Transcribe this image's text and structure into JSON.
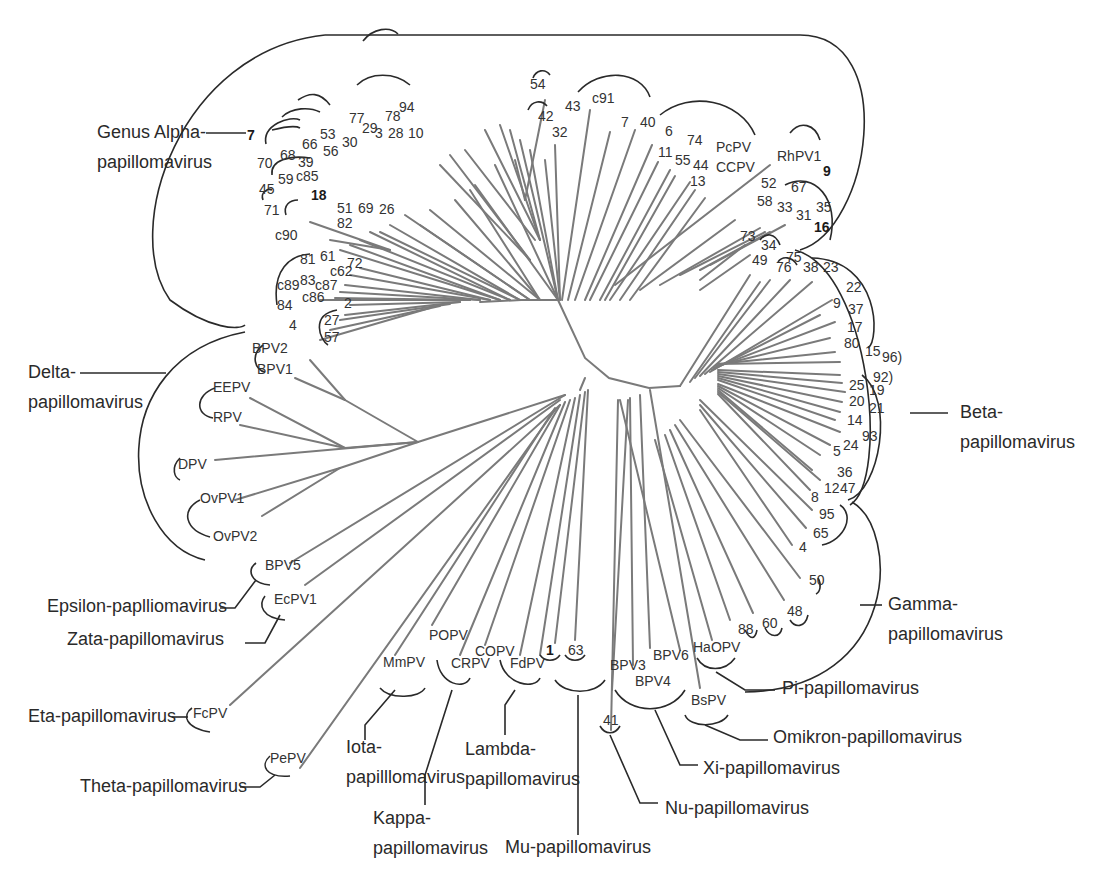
{
  "diagram": {
    "type": "unrooted-phylogenetic-tree",
    "colors": {
      "branch": "#7a7a7a",
      "bracket": "#2a2a2a",
      "text": "#333333"
    },
    "genera": [
      {
        "id": "alpha",
        "lines": [
          "Genus Alpha-",
          "papillomavirus"
        ]
      },
      {
        "id": "beta",
        "lines": [
          "Beta-",
          "papillomavirus"
        ]
      },
      {
        "id": "gamma",
        "lines": [
          "Gamma-",
          "papillomavirus"
        ]
      },
      {
        "id": "delta",
        "lines": [
          "Delta-",
          "papillomavirus"
        ]
      },
      {
        "id": "epsilon",
        "lines": [
          "Epsilon-paplliomavirus"
        ]
      },
      {
        "id": "zeta",
        "lines": [
          "Zata-papillomavirus"
        ]
      },
      {
        "id": "eta",
        "lines": [
          "Eta-papillomavirus"
        ]
      },
      {
        "id": "theta",
        "lines": [
          "Theta-papillomavirus"
        ]
      },
      {
        "id": "iota",
        "lines": [
          "Iota-",
          "papilllomavirus"
        ]
      },
      {
        "id": "kappa",
        "lines": [
          "Kappa-",
          "papillomavirus"
        ]
      },
      {
        "id": "lambda",
        "lines": [
          "Lambda-",
          "papillomavirus"
        ]
      },
      {
        "id": "mu",
        "lines": [
          "Mu-papillomavirus"
        ]
      },
      {
        "id": "nu",
        "lines": [
          "Nu-papillomavirus"
        ]
      },
      {
        "id": "xi",
        "lines": [
          "Xi-papillomavirus"
        ]
      },
      {
        "id": "omikron",
        "lines": [
          "Omikron-papillomavirus"
        ]
      },
      {
        "id": "pi",
        "lines": [
          "Pi-papillomavirus"
        ]
      }
    ],
    "leaves": {
      "alpha": [
        "7",
        "70",
        "68",
        "45",
        "59",
        "39",
        "c85",
        "18",
        "51",
        "69",
        "26",
        "82",
        "66",
        "53",
        "56",
        "30",
        "77",
        "29",
        "3",
        "78",
        "28",
        "94",
        "10",
        "54",
        "42",
        "32",
        "43",
        "c91",
        "7",
        "40",
        "6",
        "11",
        "74",
        "55",
        "44",
        "13",
        "PcPV",
        "CCPV",
        "RhPV1",
        "9",
        "52",
        "67",
        "58",
        "33",
        "31",
        "35",
        "16",
        "71",
        "c90",
        "81",
        "61",
        "72",
        "c62",
        "c89",
        "83",
        "c87",
        "c86",
        "84",
        "2",
        "27",
        "57",
        "4"
      ],
      "beta": [
        "73",
        "34",
        "49",
        "76",
        "75",
        "38",
        "23",
        "22",
        "9",
        "37",
        "17",
        "80",
        "15",
        "96",
        "92",
        "25",
        "19",
        "20",
        "21",
        "14",
        "93",
        "24",
        "5",
        "36",
        "12",
        "47",
        "8"
      ],
      "gamma": [
        "95",
        "65",
        "4",
        "50",
        "48",
        "60",
        "88"
      ],
      "delta": [
        "BPV2",
        "BPV1",
        "EEPV",
        "RPV",
        "DPV",
        "OvPV1",
        "OvPV2"
      ],
      "epsilon": [
        "BPV5"
      ],
      "zeta": [
        "EcPV1"
      ],
      "eta": [
        "FcPV"
      ],
      "theta": [
        "PePV"
      ],
      "iota": [
        "MmPV"
      ],
      "kappa": [
        "POPV",
        "CRPV"
      ],
      "lambda": [
        "COPV",
        "FdPV"
      ],
      "mu": [
        "1",
        "63"
      ],
      "nu": [
        "41"
      ],
      "xi": [
        "BPV3",
        "BPV6",
        "BPV4"
      ],
      "omikron": [
        "BsPV"
      ],
      "pi": [
        "HaOPV"
      ]
    },
    "labels": [
      {
        "t": "7",
        "x": 247,
        "y": 140,
        "b": 1
      },
      {
        "t": "70",
        "x": 257,
        "y": 168
      },
      {
        "t": "68",
        "x": 280,
        "y": 160
      },
      {
        "t": "45",
        "x": 259,
        "y": 194
      },
      {
        "t": "59",
        "x": 278,
        "y": 184
      },
      {
        "t": "39",
        "x": 298,
        "y": 167
      },
      {
        "t": "c85",
        "x": 296,
        "y": 181
      },
      {
        "t": "18",
        "x": 311,
        "y": 200,
        "b": 1
      },
      {
        "t": "51",
        "x": 337,
        "y": 213,
        "r": 1
      },
      {
        "t": "69",
        "x": 358,
        "y": 213,
        "r": 1
      },
      {
        "t": "26",
        "x": 379,
        "y": 214,
        "r": 1
      },
      {
        "t": "82",
        "x": 337,
        "y": 228,
        "r": 1
      },
      {
        "t": "66",
        "x": 302,
        "y": 149
      },
      {
        "t": "53",
        "x": 320,
        "y": 139
      },
      {
        "t": "56",
        "x": 323,
        "y": 156
      },
      {
        "t": "30",
        "x": 342,
        "y": 147
      },
      {
        "t": "77",
        "x": 349,
        "y": 123
      },
      {
        "t": "29",
        "x": 362,
        "y": 133
      },
      {
        "t": "3",
        "x": 375,
        "y": 138
      },
      {
        "t": "78",
        "x": 385,
        "y": 121
      },
      {
        "t": "28",
        "x": 388,
        "y": 138
      },
      {
        "t": "94",
        "x": 399,
        "y": 112
      },
      {
        "t": "10",
        "x": 408,
        "y": 138
      },
      {
        "t": "54",
        "x": 530,
        "y": 89
      },
      {
        "t": "42",
        "x": 538,
        "y": 121
      },
      {
        "t": "32",
        "x": 552,
        "y": 137
      },
      {
        "t": "43",
        "x": 565,
        "y": 111
      },
      {
        "t": "c91",
        "x": 592,
        "y": 103
      },
      {
        "t": "7",
        "x": 621,
        "y": 127
      },
      {
        "t": "40",
        "x": 640,
        "y": 127
      },
      {
        "t": "6",
        "x": 665,
        "y": 136
      },
      {
        "t": "11",
        "x": 658,
        "y": 157
      },
      {
        "t": "74",
        "x": 687,
        "y": 145
      },
      {
        "t": "55",
        "x": 675,
        "y": 165
      },
      {
        "t": "44",
        "x": 693,
        "y": 170
      },
      {
        "t": "13",
        "x": 690,
        "y": 186
      },
      {
        "t": "PcPV",
        "x": 716,
        "y": 152
      },
      {
        "t": "CCPV",
        "x": 716,
        "y": 172
      },
      {
        "t": "RhPV1",
        "x": 777,
        "y": 161
      },
      {
        "t": "9",
        "x": 823,
        "y": 176,
        "b": 1
      },
      {
        "t": "52",
        "x": 761,
        "y": 188
      },
      {
        "t": "67",
        "x": 791,
        "y": 192
      },
      {
        "t": "58",
        "x": 757,
        "y": 206
      },
      {
        "t": "33",
        "x": 777,
        "y": 212
      },
      {
        "t": "31",
        "x": 796,
        "y": 220
      },
      {
        "t": "35",
        "x": 816,
        "y": 212
      },
      {
        "t": "16",
        "x": 814,
        "y": 232,
        "b": 1
      },
      {
        "t": "71",
        "x": 264,
        "y": 215
      },
      {
        "t": "c90",
        "x": 275,
        "y": 240
      },
      {
        "t": "81",
        "x": 300,
        "y": 264
      },
      {
        "t": "61",
        "x": 320,
        "y": 261
      },
      {
        "t": "72",
        "x": 347,
        "y": 268
      },
      {
        "t": "c62",
        "x": 330,
        "y": 276
      },
      {
        "t": "c89",
        "x": 277,
        "y": 290
      },
      {
        "t": "83",
        "x": 300,
        "y": 285
      },
      {
        "t": "c87",
        "x": 315,
        "y": 290
      },
      {
        "t": "c86",
        "x": 302,
        "y": 302
      },
      {
        "t": "84",
        "x": 277,
        "y": 310
      },
      {
        "t": "2",
        "x": 344,
        "y": 308
      },
      {
        "t": "27",
        "x": 324,
        "y": 325
      },
      {
        "t": "57",
        "x": 324,
        "y": 342
      },
      {
        "t": "4",
        "x": 289,
        "y": 330
      },
      {
        "t": "73",
        "x": 740,
        "y": 241
      },
      {
        "t": "34",
        "x": 761,
        "y": 250
      },
      {
        "t": "49",
        "x": 752,
        "y": 265
      },
      {
        "t": "76",
        "x": 776,
        "y": 272
      },
      {
        "t": "75",
        "x": 786,
        "y": 262
      },
      {
        "t": "38",
        "x": 803,
        "y": 272
      },
      {
        "t": "23",
        "x": 823,
        "y": 272
      },
      {
        "t": "22",
        "x": 846,
        "y": 292
      },
      {
        "t": "9",
        "x": 833,
        "y": 308
      },
      {
        "t": "37",
        "x": 848,
        "y": 314
      },
      {
        "t": "17",
        "x": 847,
        "y": 332
      },
      {
        "t": "80",
        "x": 844,
        "y": 348
      },
      {
        "t": "15",
        "x": 865,
        "y": 356
      },
      {
        "t": "96)",
        "x": 882,
        "y": 362
      },
      {
        "t": "92)",
        "x": 873,
        "y": 382
      },
      {
        "t": "25",
        "x": 849,
        "y": 390
      },
      {
        "t": "19",
        "x": 869,
        "y": 395
      },
      {
        "t": "20",
        "x": 849,
        "y": 406
      },
      {
        "t": "21",
        "x": 869,
        "y": 413
      },
      {
        "t": "14",
        "x": 847,
        "y": 425
      },
      {
        "t": "93",
        "x": 862,
        "y": 441
      },
      {
        "t": "24",
        "x": 843,
        "y": 450
      },
      {
        "t": "5",
        "x": 833,
        "y": 456
      },
      {
        "t": "36",
        "x": 837,
        "y": 477
      },
      {
        "t": "12",
        "x": 824,
        "y": 493
      },
      {
        "t": "47",
        "x": 840,
        "y": 493
      },
      {
        "t": "8",
        "x": 811,
        "y": 502
      },
      {
        "t": "95",
        "x": 819,
        "y": 519
      },
      {
        "t": "65",
        "x": 813,
        "y": 538
      },
      {
        "t": "4",
        "x": 799,
        "y": 552
      },
      {
        "t": "50",
        "x": 809,
        "y": 585
      },
      {
        "t": "48",
        "x": 787,
        "y": 616
      },
      {
        "t": "60",
        "x": 762,
        "y": 628
      },
      {
        "t": "88",
        "x": 738,
        "y": 634
      },
      {
        "t": "BPV2",
        "x": 252,
        "y": 353
      },
      {
        "t": "BPV1",
        "x": 257,
        "y": 374
      },
      {
        "t": "EEPV",
        "x": 213,
        "y": 392
      },
      {
        "t": "RPV",
        "x": 213,
        "y": 422
      },
      {
        "t": "DPV",
        "x": 178,
        "y": 469
      },
      {
        "t": "OvPV1",
        "x": 200,
        "y": 503
      },
      {
        "t": "OvPV2",
        "x": 213,
        "y": 541
      },
      {
        "t": "BPV5",
        "x": 265,
        "y": 570
      },
      {
        "t": "EcPV1",
        "x": 274,
        "y": 604
      },
      {
        "t": "FcPV",
        "x": 193,
        "y": 718
      },
      {
        "t": "PePV",
        "x": 270,
        "y": 763
      },
      {
        "t": "MmPV",
        "x": 383,
        "y": 667
      },
      {
        "t": "POPV",
        "x": 429,
        "y": 640
      },
      {
        "t": "CRPV",
        "x": 451,
        "y": 668
      },
      {
        "t": "COPV",
        "x": 475,
        "y": 656
      },
      {
        "t": "FdPV",
        "x": 510,
        "y": 668
      },
      {
        "t": "1",
        "x": 546,
        "y": 655,
        "b": 1
      },
      {
        "t": "63",
        "x": 568,
        "y": 655
      },
      {
        "t": "41",
        "x": 603,
        "y": 725
      },
      {
        "t": "BPV3",
        "x": 610,
        "y": 670
      },
      {
        "t": "BPV6",
        "x": 653,
        "y": 660
      },
      {
        "t": "BPV4",
        "x": 635,
        "y": 686
      },
      {
        "t": "BsPV",
        "x": 691,
        "y": 705
      },
      {
        "t": "HaOPV",
        "x": 693,
        "y": 652
      }
    ],
    "genus_labels": [
      {
        "lines": [
          "Genus Alpha-",
          "papillomavirus"
        ],
        "x": 97,
        "y": 138,
        "lh": 30
      },
      {
        "lines": [
          "Delta-",
          "papillomavirus"
        ],
        "x": 28,
        "y": 378,
        "lh": 30
      },
      {
        "lines": [
          "Beta-",
          "papillomavirus"
        ],
        "x": 960,
        "y": 418,
        "lh": 30
      },
      {
        "lines": [
          "Gamma-",
          "papillomavirus"
        ],
        "x": 888,
        "y": 610,
        "lh": 30
      },
      {
        "lines": [
          "Epsilon-paplliomavirus"
        ],
        "x": 47,
        "y": 612,
        "lh": 30
      },
      {
        "lines": [
          "Zata-papillomavirus"
        ],
        "x": 67,
        "y": 645,
        "lh": 30
      },
      {
        "lines": [
          "Eta-papillomavirus"
        ],
        "x": 28,
        "y": 722,
        "lh": 30
      },
      {
        "lines": [
          "Theta-papillomavirus"
        ],
        "x": 80,
        "y": 792,
        "lh": 30
      },
      {
        "lines": [
          "Iota-",
          "papilllomavirus"
        ],
        "x": 346,
        "y": 753,
        "lh": 30
      },
      {
        "lines": [
          "Kappa-",
          "papillomavirus"
        ],
        "x": 373,
        "y": 824,
        "lh": 30
      },
      {
        "lines": [
          "Lambda-",
          "papillomavirus"
        ],
        "x": 465,
        "y": 755,
        "lh": 30
      },
      {
        "lines": [
          "Mu-papillomavirus"
        ],
        "x": 505,
        "y": 853,
        "lh": 30
      },
      {
        "lines": [
          "Nu-papillomavirus"
        ],
        "x": 665,
        "y": 814,
        "lh": 30
      },
      {
        "lines": [
          "Xi-papillomavirus"
        ],
        "x": 703,
        "y": 774,
        "lh": 30
      },
      {
        "lines": [
          "Omikron-papillomavirus"
        ],
        "x": 773,
        "y": 743,
        "lh": 30
      },
      {
        "lines": [
          "Pi-papillomavirus"
        ],
        "x": 782,
        "y": 694,
        "lh": 30
      }
    ]
  }
}
